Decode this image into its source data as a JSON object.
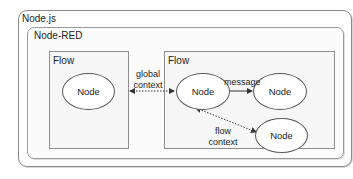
{
  "diagram": {
    "containers": {
      "nodejs": {
        "label": "Node.js"
      },
      "nodered": {
        "label": "Node-RED"
      },
      "flow_left": {
        "label": "Flow"
      },
      "flow_right": {
        "label": "Flow"
      }
    },
    "nodes": [
      {
        "id": "n1",
        "label": "Node",
        "container": "flow_left"
      },
      {
        "id": "n2",
        "label": "Node",
        "container": "flow_right"
      },
      {
        "id": "n3",
        "label": "Node",
        "container": "flow_right"
      },
      {
        "id": "n4",
        "label": "Node",
        "container": "flow_right"
      }
    ],
    "edges": [
      {
        "from": "n1",
        "to": "n2",
        "label_line1": "global",
        "label_line2": "context",
        "style": "dotted",
        "direction": "both"
      },
      {
        "from": "n2",
        "to": "n3",
        "label": "message",
        "style": "solid",
        "direction": "forward"
      },
      {
        "from": "n2",
        "to": "n4",
        "label_line1": "flow",
        "label_line2": "context",
        "style": "dotted",
        "direction": "both"
      }
    ],
    "colors": {
      "border": "#8d8d8d",
      "flow_fill": "#f6f6f6",
      "node_fill": "#ffffff",
      "line": "#333333"
    }
  }
}
